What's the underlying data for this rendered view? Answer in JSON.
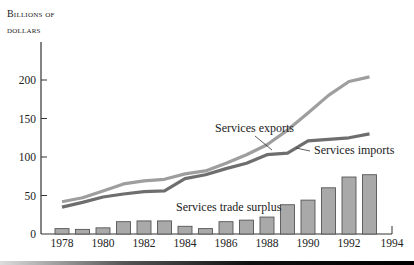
{
  "chart_data": {
    "type": "bar+line",
    "title": "",
    "ylabel": "Billions of dollars",
    "ylabel_lines": [
      "Billions of",
      "dollars"
    ],
    "xlabel": "",
    "ylim": [
      0,
      225
    ],
    "xlim": [
      1977,
      1994
    ],
    "yticks": [
      0,
      50,
      100,
      150,
      200
    ],
    "xticks": [
      1978,
      1980,
      1982,
      1984,
      1986,
      1988,
      1990,
      1992,
      1994
    ],
    "grid": false,
    "legend": "inline annotations",
    "categories": [
      1978,
      1979,
      1980,
      1981,
      1982,
      1983,
      1984,
      1985,
      1986,
      1987,
      1988,
      1989,
      1990,
      1991,
      1992,
      1993
    ],
    "series": [
      {
        "name": "Services exports",
        "type": "line",
        "color": "#9e9e9e",
        "values": [
          42,
          47,
          56,
          65,
          69,
          71,
          78,
          82,
          92,
          103,
          116,
          135,
          157,
          180,
          198,
          204
        ]
      },
      {
        "name": "Services imports",
        "type": "line",
        "color": "#6e6e6e",
        "values": [
          35,
          41,
          48,
          52,
          55,
          56,
          72,
          77,
          85,
          92,
          103,
          105,
          121,
          123,
          125,
          130
        ]
      },
      {
        "name": "Services trade surplus",
        "type": "bar",
        "color": "#a9a9a9",
        "values": [
          7,
          6,
          8,
          16,
          17,
          17,
          10,
          7,
          16,
          18,
          22,
          38,
          44,
          60,
          74,
          77
        ]
      }
    ],
    "annotations": [
      {
        "text": "Services exports",
        "x": 1986.5,
        "y": 155
      },
      {
        "text": "Services imports",
        "x": 1989.4,
        "y": 100
      },
      {
        "text": "Services trade surplus",
        "x": 1984.5,
        "y": 45
      }
    ]
  }
}
